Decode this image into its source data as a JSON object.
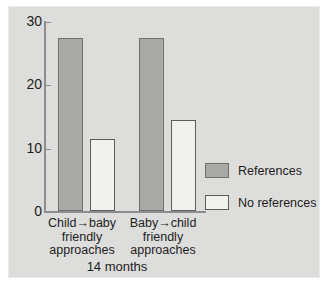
{
  "chart_data": {
    "type": "bar",
    "title": "",
    "subtitle": "",
    "xlabel": "14 months",
    "ylabel": "",
    "categories": [
      "Child→baby friendly approaches",
      "Baby→child friendly approaches"
    ],
    "category_lines": [
      [
        "Child→baby",
        "friendly",
        "approaches"
      ],
      [
        "Baby→child",
        "friendly",
        "approaches"
      ]
    ],
    "series": [
      {
        "name": "References",
        "values": [
          27.3,
          27.3
        ],
        "color": "#a9a9a8"
      },
      {
        "name": "No references",
        "values": [
          11.4,
          14.4
        ],
        "color": "#f1f1ef"
      }
    ],
    "ylim": [
      0,
      30
    ],
    "yticks": [
      0,
      10,
      20,
      30
    ],
    "ytick_labels": [
      "0",
      "10",
      "20",
      "30"
    ],
    "grid": false,
    "legend_position": "right"
  },
  "legend": {
    "entries": [
      {
        "label": "References",
        "swatch": "references-swatch"
      },
      {
        "label": "No references",
        "swatch": "no-references-swatch"
      }
    ]
  },
  "colors": {
    "panel_background": "#dddddc",
    "panel_border": "#e9e9e8",
    "axis": "#8d8d8d",
    "text": "#1d1d1d",
    "references_fill": "#a9a9a8",
    "references_stroke": "#6f6f6e",
    "no_references_fill": "#f1f1ef",
    "no_references_stroke": "#5d5d5c"
  }
}
